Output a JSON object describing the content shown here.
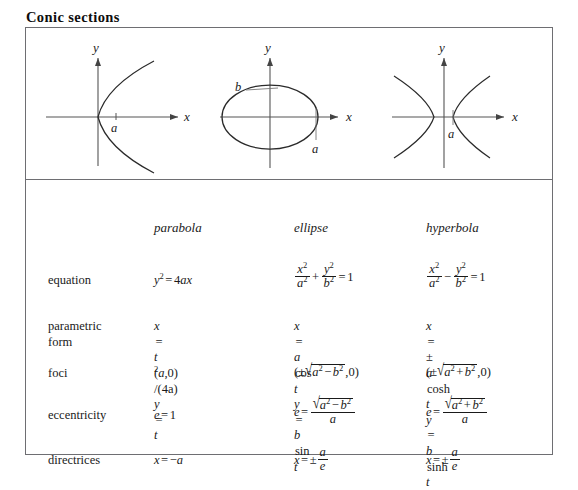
{
  "title": "Conic sections",
  "figures": {
    "parabola": {
      "name": "parabola",
      "x_axis_label": "x",
      "y_axis_label": "y",
      "point_label_a": "a"
    },
    "ellipse": {
      "name": "ellipse",
      "x_axis_label": "x",
      "y_axis_label": "y",
      "semi_major_label": "a",
      "semi_minor_label": "b"
    },
    "hyperbola": {
      "name": "hyperbola",
      "x_axis_label": "x",
      "y_axis_label": "y",
      "vertex_label": "a"
    }
  },
  "table": {
    "column_headers": [
      "",
      "parabola",
      "ellipse",
      "hyperbola"
    ],
    "row_labels": {
      "equation": "equation",
      "parametric_form_line1": "parametric",
      "parametric_form_line2": "form",
      "foci": "foci",
      "eccentricity": "eccentricity",
      "directrices": "directrices"
    },
    "equation": {
      "parabola": {
        "lhs": "y",
        "lhs_exp": "2",
        "rel": "=",
        "rhs_coef": "4",
        "rhs_vars": "ax"
      },
      "ellipse": {
        "t1_num_var": "x",
        "t1_num_exp": "2",
        "t1_den_var": "a",
        "t1_den_exp": "2",
        "op": "+",
        "t2_num_var": "y",
        "t2_num_exp": "2",
        "t2_den_var": "b",
        "t2_den_exp": "2",
        "rel": "=",
        "rhs": "1"
      },
      "hyperbola": {
        "t1_num_var": "x",
        "t1_num_exp": "2",
        "t1_den_var": "a",
        "t1_den_exp": "2",
        "op": "−",
        "t2_num_var": "y",
        "t2_num_exp": "2",
        "t2_den_var": "b",
        "t2_den_exp": "2",
        "rel": "=",
        "rhs": "1"
      }
    },
    "parametric": {
      "parabola": {
        "x_lhs": "x",
        "x_rel": "=",
        "x_num_var": "t",
        "x_num_exp": "2",
        "x_den": "/(4a)",
        "y_lhs": "y",
        "y_rel": "=",
        "y_rhs": "t"
      },
      "ellipse": {
        "x_lhs": "x",
        "x_rel": "=",
        "x_coef": "a",
        "x_fn": "cos",
        "x_arg": "t",
        "y_lhs": "y",
        "y_rel": "=",
        "y_coef": "b",
        "y_fn": "sin",
        "y_arg": "t"
      },
      "hyperbola": {
        "x_lhs": "x",
        "x_rel": "=",
        "x_sign": "±",
        "x_coef": "a",
        "x_fn": "cosh",
        "x_arg": "t",
        "y_lhs": "y",
        "y_rel": "=",
        "y_coef": "b",
        "y_fn": "sinh",
        "y_arg": "t"
      }
    },
    "foci": {
      "parabola": {
        "open": "(",
        "var": "a",
        "comma": ",",
        "zero": "0",
        "close": ")"
      },
      "ellipse": {
        "open": "(",
        "sign": "±",
        "rad_a": "a",
        "rad_a_exp": "2",
        "rad_op": "−",
        "rad_b": "b",
        "rad_b_exp": "2",
        "comma": ",",
        "zero": "0",
        "close": ")"
      },
      "hyperbola": {
        "open": "(",
        "sign": "±",
        "rad_a": "a",
        "rad_a_exp": "2",
        "rad_op": "+",
        "rad_b": "b",
        "rad_b_exp": "2",
        "comma": ",",
        "zero": "0",
        "close": ")"
      }
    },
    "eccentricity": {
      "parabola": {
        "lhs": "e",
        "rel": "=",
        "rhs": "1"
      },
      "ellipse": {
        "lhs": "e",
        "rel": "=",
        "rad_a": "a",
        "rad_a_exp": "2",
        "rad_op": "−",
        "rad_b": "b",
        "rad_b_exp": "2",
        "den": "a"
      },
      "hyperbola": {
        "lhs": "e",
        "rel": "=",
        "rad_a": "a",
        "rad_a_exp": "2",
        "rad_op": "+",
        "rad_b": "b",
        "rad_b_exp": "2",
        "den": "a"
      }
    },
    "directrices": {
      "parabola": {
        "lhs": "x",
        "rel": "=",
        "sign": "−",
        "rhs": "a"
      },
      "ellipse": {
        "lhs": "x",
        "rel": "=",
        "sign": "±",
        "num": "a",
        "den": "e"
      },
      "hyperbola": {
        "lhs": "x",
        "rel": "=",
        "sign": "±",
        "num": "a",
        "den": "e"
      }
    }
  }
}
